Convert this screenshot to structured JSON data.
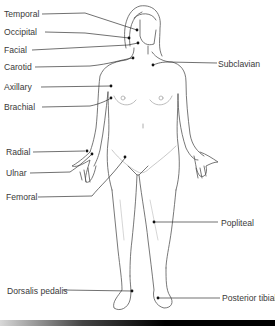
{
  "colors": {
    "line": "#333333",
    "figure": "#555555",
    "figure_light": "#bbbbbb",
    "text": "#3a3a3a",
    "dot": "#111111"
  },
  "labels_left": [
    {
      "id": "temporal",
      "text": "Temporal",
      "x": 4,
      "y": 9
    },
    {
      "id": "occipital",
      "text": "Occipital",
      "x": 4,
      "y": 27
    },
    {
      "id": "facial",
      "text": "Facial",
      "x": 4,
      "y": 45
    },
    {
      "id": "carotid",
      "text": "Carotid",
      "x": 4,
      "y": 62
    },
    {
      "id": "axillary",
      "text": "Axillary",
      "x": 4,
      "y": 82
    },
    {
      "id": "brachial",
      "text": "Brachial",
      "x": 4,
      "y": 102
    },
    {
      "id": "radial",
      "text": "Radial",
      "x": 6,
      "y": 147
    },
    {
      "id": "ulnar",
      "text": "Ulnar",
      "x": 6,
      "y": 168
    },
    {
      "id": "femoral",
      "text": "Femoral",
      "x": 6,
      "y": 192
    },
    {
      "id": "dorsalis-pedalis",
      "text": "Dorsalis pedalis",
      "x": 7,
      "y": 286
    }
  ],
  "labels_right": [
    {
      "id": "subclavian",
      "text": "Subclavian",
      "x": 218,
      "y": 59
    },
    {
      "id": "popliteal",
      "text": "Popliteal",
      "x": 221,
      "y": 218
    },
    {
      "id": "posterior-tibial",
      "text": "Posterior tibial",
      "x": 222,
      "y": 293
    }
  ]
}
